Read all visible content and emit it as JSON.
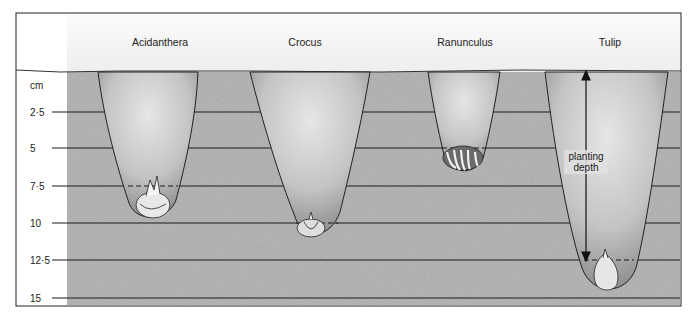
{
  "diagram": {
    "unit_label": "cm",
    "depth_scale": [
      {
        "label": "2·5",
        "value": 2.5,
        "y": 112
      },
      {
        "label": "5",
        "value": 5,
        "y": 148
      },
      {
        "label": "7·5",
        "value": 7.5,
        "y": 186
      },
      {
        "label": "10",
        "value": 10,
        "y": 223
      },
      {
        "label": "12·5",
        "value": 12.5,
        "y": 260
      },
      {
        "label": "15",
        "value": 15,
        "y": 298
      }
    ],
    "plants": [
      {
        "name": "Acidanthera",
        "label_x": 160,
        "planting_depth_cm": 7.5,
        "bulb": "corm-with-shoot-icon"
      },
      {
        "name": "Crocus",
        "label_x": 305,
        "planting_depth_cm": 10,
        "bulb": "corm-icon"
      },
      {
        "name": "Ranunculus",
        "label_x": 465,
        "planting_depth_cm": 5,
        "bulb": "tuberous-root-claw-icon"
      },
      {
        "name": "Tulip",
        "label_x": 610,
        "planting_depth_cm": 12.5,
        "bulb": "bulb-icon"
      }
    ],
    "annotation": {
      "line1": "planting",
      "line2": "depth",
      "icon": "double-arrow-vertical-icon"
    },
    "colors": {
      "soil": "#b9b9b9",
      "hole": "#d2d2d2",
      "hole_shadow": "#8a8a8a",
      "line": "#1a1a1a",
      "sky": "#f6f6f6"
    }
  }
}
